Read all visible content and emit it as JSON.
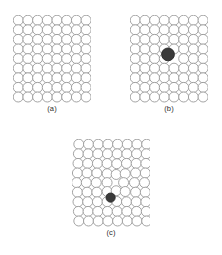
{
  "figure": {
    "type": "crystal-lattice-defect-diagram",
    "background_color": "#ffffff",
    "atom_outline_color": "#9a9a9a",
    "atom_fill_color": "#ffffff",
    "defect_fill_color": "#3a3a3a",
    "defect_outline_color": "#2a2a2a",
    "label_color": "#2b2b2b",
    "atom_outline_width": 0.9,
    "panels": [
      {
        "id": "panel-a",
        "label": "(a)",
        "description": "perfect lattice",
        "left": 13,
        "top": 15,
        "width": 78,
        "height": 88,
        "label_top": 104,
        "rows": 9,
        "cols": 8,
        "atom_radius": 5.0,
        "x_spacing": 9.7,
        "y_spacing": 9.6,
        "x_origin": 5.2,
        "y_origin": 5.2,
        "row_offsets": [
          0,
          0,
          0,
          0,
          0,
          0,
          0,
          0,
          0
        ],
        "defect": null
      },
      {
        "id": "panel-b",
        "label": "(b)",
        "description": "lattice with larger substitutional impurity atom",
        "left": 130,
        "top": 15,
        "width": 78,
        "height": 88,
        "label_top": 104,
        "rows": 9,
        "cols": 8,
        "atom_radius": 5.0,
        "x_spacing": 9.7,
        "y_spacing": 9.6,
        "x_origin": 5.2,
        "y_origin": 5.2,
        "row_offsets": [
          0,
          0,
          0,
          0,
          0,
          0,
          0,
          0,
          0
        ],
        "defect": {
          "row": 4,
          "col": 4,
          "cx": 38.0,
          "cy": 39.4,
          "radius": 6.4,
          "kind": "oversized-substitutional"
        }
      },
      {
        "id": "panel-c",
        "label": "(c)",
        "description": "lattice with smaller substitutional impurity causing inward lattice distortion",
        "left": 72,
        "top": 139,
        "width": 78,
        "height": 88,
        "label_top": 228,
        "rows": 9,
        "cols": 8,
        "atom_radius": 5.0,
        "x_spacing": 9.7,
        "y_spacing": 9.6,
        "x_origin": 5.2,
        "y_origin": 5.2,
        "row_offsets": [
          1.6,
          1.2,
          0.8,
          0.2,
          -0.6,
          0.2,
          0.8,
          1.2,
          1.6
        ],
        "distortion": {
          "center_row": 4,
          "center_col": 4,
          "pull_strength": 2.6,
          "pull_radius": 22.0
        },
        "defect": {
          "row": 4,
          "col": 4,
          "cx": 38.6,
          "cy": 58.6,
          "radius": 4.6,
          "kind": "undersized-substitutional"
        }
      }
    ]
  }
}
